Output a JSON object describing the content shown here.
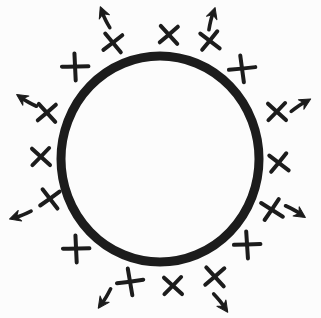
{
  "diagram": {
    "background": "#fcfcfc",
    "ink": "#1c1c1c",
    "canvas": {
      "width": 321,
      "height": 318
    },
    "circle": {
      "cx": 160,
      "cy": 159,
      "rx": 99,
      "ry": 103,
      "stroke_width": 9
    },
    "x_style": {
      "stroke_width": 4
    },
    "arrow_style": {
      "stroke_width": 3.6,
      "shaft_length": 13,
      "head_length": 10,
      "head_width": 11
    },
    "x_marks": [
      {
        "x": 169,
        "y": 35,
        "rot": 5,
        "s": 9
      },
      {
        "x": 210,
        "y": 41,
        "rot": -5,
        "s": 9
      },
      {
        "x": 242,
        "y": 69,
        "rot": 40,
        "s": 10
      },
      {
        "x": 277,
        "y": 112,
        "rot": 0,
        "s": 9
      },
      {
        "x": 279,
        "y": 163,
        "rot": -5,
        "s": 9
      },
      {
        "x": 272,
        "y": 210,
        "rot": -10,
        "s": 9.5
      },
      {
        "x": 247,
        "y": 245,
        "rot": 44,
        "s": 10
      },
      {
        "x": 215,
        "y": 277,
        "rot": 5,
        "s": 9.5
      },
      {
        "x": 173,
        "y": 286,
        "rot": 0,
        "s": 9
      },
      {
        "x": 130,
        "y": 282,
        "rot": 38,
        "s": 10
      },
      {
        "x": 76,
        "y": 249,
        "rot": 45,
        "s": 10
      },
      {
        "x": 50,
        "y": 199,
        "rot": 10,
        "s": 9
      },
      {
        "x": 41,
        "y": 157,
        "rot": 0,
        "s": 9
      },
      {
        "x": 47,
        "y": 113,
        "rot": 5,
        "s": 9
      },
      {
        "x": 75,
        "y": 67,
        "rot": 45,
        "s": 10
      },
      {
        "x": 113,
        "y": 43,
        "rot": 8,
        "s": 9
      }
    ],
    "arrows": [
      {
        "x": 104,
        "y": 16,
        "rot": -112
      },
      {
        "x": 212,
        "y": 17,
        "rot": -72
      },
      {
        "x": 302,
        "y": 104,
        "rot": -30
      },
      {
        "x": 297,
        "y": 212,
        "rot": 33
      },
      {
        "x": 222,
        "y": 304,
        "rot": 55
      },
      {
        "x": 104,
        "y": 300,
        "rot": 125
      },
      {
        "x": 19,
        "y": 216,
        "rot": 162
      },
      {
        "x": 25,
        "y": 100,
        "rot": -147
      }
    ]
  }
}
